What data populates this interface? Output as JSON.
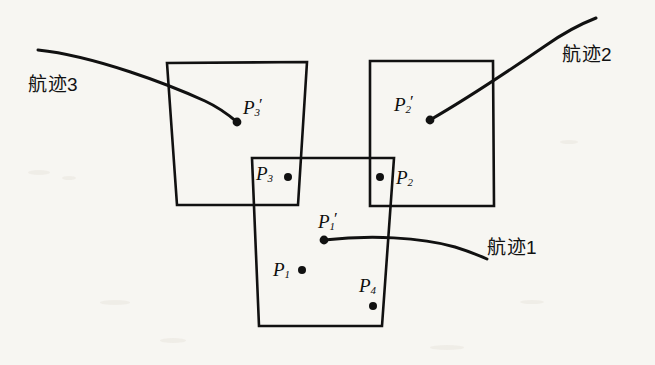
{
  "figure": {
    "background_color": "#f7f6f2",
    "ink_color": "#111111",
    "width": 655,
    "height": 365
  },
  "track_labels": [
    {
      "id": "track-3",
      "text": "航迹3",
      "x": 28,
      "y": 75
    },
    {
      "id": "track-2",
      "text": "航迹2",
      "x": 562,
      "y": 45
    },
    {
      "id": "track-1",
      "text": "航迹1",
      "x": 487,
      "y": 238
    }
  ],
  "point_labels": [
    {
      "id": "p3-prime",
      "base": "P",
      "sub": "3",
      "prime": "′",
      "x": 243,
      "y": 96
    },
    {
      "id": "p2-prime",
      "base": "P",
      "sub": "2",
      "prime": "′",
      "x": 394,
      "y": 93
    },
    {
      "id": "p1-prime",
      "base": "P",
      "sub": "1",
      "prime": "′",
      "x": 318,
      "y": 210
    },
    {
      "id": "p3",
      "base": "P",
      "sub": "3",
      "prime": "",
      "x": 256,
      "y": 164
    },
    {
      "id": "p2",
      "base": "P",
      "sub": "2",
      "prime": "",
      "x": 396,
      "y": 168
    },
    {
      "id": "p1",
      "base": "P",
      "sub": "1",
      "prime": "",
      "x": 273,
      "y": 260
    },
    {
      "id": "p4",
      "base": "P",
      "sub": "4",
      "prime": "",
      "x": 359,
      "y": 276
    }
  ],
  "points": [
    {
      "id": "dot-p3-prime",
      "cx": 237,
      "cy": 122,
      "r": 4.4
    },
    {
      "id": "dot-p2-prime",
      "cx": 430,
      "cy": 120,
      "r": 4.4
    },
    {
      "id": "dot-p1-prime",
      "cx": 324,
      "cy": 240,
      "r": 4.4
    },
    {
      "id": "dot-p3",
      "cx": 288,
      "cy": 177,
      "r": 4.0
    },
    {
      "id": "dot-p2",
      "cx": 380,
      "cy": 177,
      "r": 4.0
    },
    {
      "id": "dot-p1",
      "cx": 302,
      "cy": 270,
      "r": 4.0
    },
    {
      "id": "dot-p4",
      "cx": 373,
      "cy": 306,
      "r": 4.0
    }
  ],
  "gates": [
    {
      "id": "gate-left",
      "name": "left-gate-rectangle",
      "points": "167,63 307,62 298,205 177,205",
      "stroke_width": 2.6
    },
    {
      "id": "gate-right",
      "name": "right-gate-rectangle",
      "points": "370,61 493,61 494,206 370,206",
      "stroke_width": 2.6
    },
    {
      "id": "gate-middle",
      "name": "middle-gate-rectangle",
      "points": "252,158 394,158 382,326 259,326",
      "stroke_width": 2.6
    }
  ],
  "tracks": [
    {
      "id": "curve-track-3",
      "name": "track-3-curve",
      "path": "M 38,50 C 95,56 170,85 205,101 C 220,108 230,116 237,122",
      "stroke_width": 3.0
    },
    {
      "id": "curve-track-2",
      "name": "track-2-curve",
      "path": "M 430,120 C 470,97 510,70 545,46 C 562,34 578,25 596,18",
      "stroke_width": 3.0
    },
    {
      "id": "curve-track-1",
      "name": "track-1-curve",
      "path": "M 324,240 C 370,235 420,237 455,247 C 468,251 478,255 487,259",
      "stroke_width": 3.0
    }
  ]
}
